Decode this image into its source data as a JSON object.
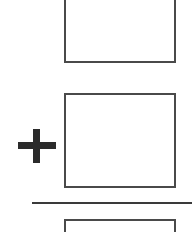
{
  "worksheet": {
    "operation": "addition",
    "operator_symbol": "+",
    "addend_1": {
      "value": ""
    },
    "addend_2": {
      "value": ""
    },
    "sum": {
      "value": ""
    }
  },
  "colors": {
    "box_border": "#4a4a4a",
    "operator": "#2b2b2b",
    "rule": "#3a3a3a",
    "background": "#ffffff"
  }
}
